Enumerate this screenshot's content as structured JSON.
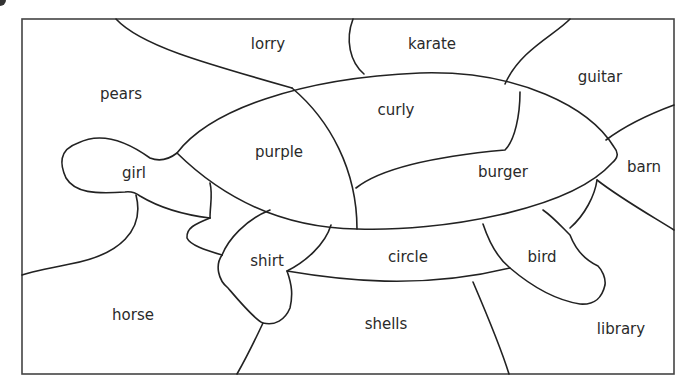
{
  "worksheet": {
    "title": "",
    "colors": {
      "line": "#222222",
      "frame": "#444444",
      "text": "#2a2a2a",
      "background": "#ffffff"
    },
    "regions": [
      {
        "id": "lorry",
        "label": "lorry",
        "x": 268,
        "y": 44
      },
      {
        "id": "karate",
        "label": "karate",
        "x": 432,
        "y": 44
      },
      {
        "id": "pears",
        "label": "pears",
        "x": 121,
        "y": 94
      },
      {
        "id": "guitar",
        "label": "guitar",
        "x": 600,
        "y": 77
      },
      {
        "id": "curly",
        "label": "curly",
        "x": 396,
        "y": 110
      },
      {
        "id": "purple",
        "label": "purple",
        "x": 279,
        "y": 152
      },
      {
        "id": "girl",
        "label": "girl",
        "x": 134,
        "y": 173
      },
      {
        "id": "burger",
        "label": "burger",
        "x": 503,
        "y": 172
      },
      {
        "id": "barn",
        "label": "barn",
        "x": 644,
        "y": 167
      },
      {
        "id": "shirt",
        "label": "shirt",
        "x": 267,
        "y": 261
      },
      {
        "id": "circle",
        "label": "circle",
        "x": 408,
        "y": 257
      },
      {
        "id": "bird",
        "label": "bird",
        "x": 542,
        "y": 257
      },
      {
        "id": "horse",
        "label": "horse",
        "x": 133,
        "y": 315
      },
      {
        "id": "shells",
        "label": "shells",
        "x": 386,
        "y": 324
      },
      {
        "id": "library",
        "label": "library",
        "x": 621,
        "y": 329
      }
    ]
  }
}
